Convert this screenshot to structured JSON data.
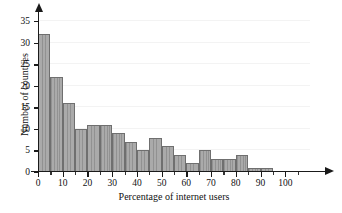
{
  "chart_data": {
    "type": "bar",
    "title": "",
    "subtitle": "",
    "xlabel": "Percentage of internet users",
    "ylabel": "Number of countries",
    "bin_width": 5,
    "bin_starts": [
      0,
      5,
      10,
      15,
      20,
      25,
      30,
      35,
      40,
      45,
      50,
      55,
      60,
      65,
      70,
      75,
      80,
      85,
      90
    ],
    "categories": [
      "0-5",
      "5-10",
      "10-15",
      "15-20",
      "20-25",
      "25-30",
      "30-35",
      "35-40",
      "40-45",
      "45-50",
      "50-55",
      "55-60",
      "60-65",
      "65-70",
      "70-75",
      "75-80",
      "80-85",
      "85-90",
      "90-95"
    ],
    "values": [
      32,
      22,
      16,
      10,
      11,
      11,
      9,
      7,
      5,
      8,
      6,
      4,
      2,
      5,
      3,
      3,
      4,
      1,
      1
    ],
    "xlim": [
      0,
      110
    ],
    "ylim": [
      0,
      36
    ],
    "xticks": [
      0,
      10,
      20,
      30,
      40,
      50,
      60,
      70,
      80,
      90,
      100
    ],
    "xtick_labels": [
      "0",
      "10",
      "20",
      "30",
      "40",
      "50",
      "60",
      "70",
      "80",
      "90",
      "100"
    ],
    "xticks_minor": [
      5,
      15,
      25,
      35,
      45,
      55,
      65,
      75,
      85,
      95,
      105
    ],
    "yticks": [
      0,
      5,
      10,
      15,
      20,
      25,
      30,
      35
    ],
    "ytick_labels": [
      "0",
      "5",
      "10",
      "15",
      "20",
      "25",
      "30",
      "35"
    ],
    "grid": "horizontal",
    "legend": "none",
    "colors": {
      "bar_fill": "#aaaaaa",
      "bar_edge": "#6f6f6f",
      "axis": "#1a1a1a",
      "grid": "#f3f3f3",
      "text": "#111111",
      "background": "#ffffff"
    }
  }
}
